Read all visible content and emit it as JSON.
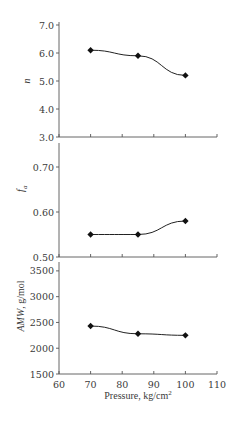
{
  "chart_data": [
    {
      "type": "line",
      "panel": "top",
      "ylabel": "n",
      "ylabel_italic": true,
      "x": [
        70,
        85,
        100
      ],
      "values": [
        6.1,
        5.9,
        5.2
      ],
      "ylim": [
        3.0,
        7.0
      ],
      "yticks": [
        3.0,
        4.0,
        5.0,
        6.0,
        7.0
      ],
      "ytick_labels": [
        "3.0",
        "4.0",
        "5.0",
        "6.0",
        "7.0"
      ],
      "xlim": [
        60,
        110
      ],
      "xticks": [
        60,
        70,
        80,
        90,
        100,
        110
      ],
      "grid": false,
      "marker": "diamond"
    },
    {
      "type": "line",
      "panel": "middle",
      "ylabel": "f",
      "ylabel_subscript": "a",
      "ylabel_italic": true,
      "x": [
        70,
        85,
        100
      ],
      "values": [
        0.55,
        0.55,
        0.58
      ],
      "ylim": [
        0.5,
        0.75
      ],
      "yticks": [
        0.5,
        0.6,
        0.7
      ],
      "ytick_labels": [
        "0.50",
        "0.60",
        "0.70"
      ],
      "xlim": [
        60,
        110
      ],
      "xticks": [
        60,
        70,
        80,
        90,
        100,
        110
      ],
      "grid": false,
      "marker": "diamond"
    },
    {
      "type": "line",
      "panel": "bottom",
      "ylabel": "AMW, g/mol",
      "ylabel_italic_part": "AMW",
      "ylabel_rest": ", g/mol",
      "x": [
        70,
        85,
        100
      ],
      "values": [
        2430,
        2280,
        2250
      ],
      "ylim": [
        1500,
        3750
      ],
      "yticks": [
        1500,
        2000,
        2500,
        3000,
        3500
      ],
      "ytick_labels": [
        "1500",
        "2000",
        "2500",
        "3000",
        "3500"
      ],
      "xlim": [
        60,
        110
      ],
      "xticks": [
        60,
        70,
        80,
        90,
        100,
        110
      ],
      "xtick_labels": [
        "60",
        "70",
        "80",
        "90",
        "100",
        "110"
      ],
      "xlabel": "Pressure, kg/cm",
      "xlabel_superscript": "2",
      "grid": false,
      "marker": "diamond"
    }
  ],
  "colors": {
    "line": "#222222",
    "marker": "#111111",
    "axis": "#555555",
    "text": "#3a3a3a"
  }
}
